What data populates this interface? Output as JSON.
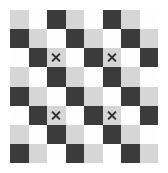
{
  "figure": {
    "kind": "checkerboard-grid",
    "background_color": "#ffffff",
    "rows": 8,
    "columns": 8,
    "palette": {
      "light_gray": "#d6d6d6",
      "white": "#fefefe",
      "dark_gray": "#3b3b3b",
      "mark_color": "#2d2d2d"
    },
    "mark_glyph": "×",
    "mark_label": "x-mark",
    "cells": [
      [
        "light",
        "white",
        "dark",
        "light",
        "white",
        "dark",
        "light",
        "white"
      ],
      [
        "dark",
        "light",
        "white",
        "dark",
        "light",
        "white",
        "dark",
        "light"
      ],
      [
        "white",
        "dark",
        "light",
        "white",
        "dark",
        "light",
        "white",
        "dark"
      ],
      [
        "light",
        "white",
        "dark",
        "light",
        "white",
        "dark",
        "light",
        "white"
      ],
      [
        "dark",
        "light",
        "white",
        "dark",
        "light",
        "white",
        "dark",
        "light"
      ],
      [
        "white",
        "dark",
        "light",
        "white",
        "dark",
        "light",
        "white",
        "dark"
      ],
      [
        "light",
        "white",
        "dark",
        "light",
        "white",
        "dark",
        "light",
        "white"
      ],
      [
        "dark",
        "light",
        "white",
        "dark",
        "light",
        "white",
        "dark",
        "light"
      ]
    ],
    "marks": [
      {
        "row": 2,
        "col": 2
      },
      {
        "row": 2,
        "col": 5
      },
      {
        "row": 5,
        "col": 2
      },
      {
        "row": 5,
        "col": 5
      }
    ]
  }
}
